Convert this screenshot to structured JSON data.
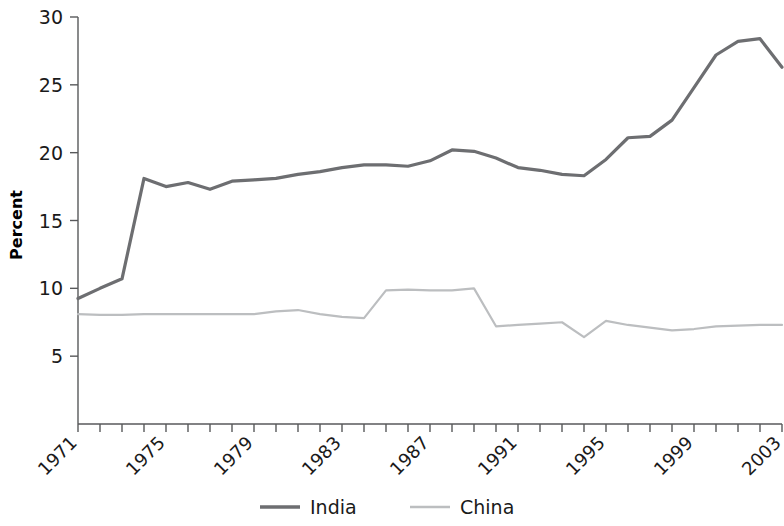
{
  "chart_data": {
    "type": "line",
    "title": "",
    "subtitle": "",
    "xlabel": "",
    "ylabel": "Percent",
    "xlim": [
      1971,
      2003
    ],
    "ylim": [
      0,
      30
    ],
    "yticks": [
      5,
      10,
      15,
      20,
      25,
      30
    ],
    "ytick_labels": [
      "5",
      "10",
      "15",
      "20",
      "25",
      "30"
    ],
    "xticks": [
      1971,
      1975,
      1979,
      1983,
      1987,
      1991,
      1995,
      1999,
      2003
    ],
    "xtick_labels": [
      "1971",
      "1975",
      "1979",
      "1983",
      "1987",
      "1991",
      "1995",
      "1999",
      "2003"
    ],
    "xtick_minor_every": 1,
    "grid": false,
    "legend_position": "bottom-center",
    "x": [
      1971,
      1972,
      1973,
      1974,
      1975,
      1976,
      1977,
      1978,
      1979,
      1980,
      1981,
      1982,
      1983,
      1984,
      1985,
      1986,
      1987,
      1988,
      1989,
      1990,
      1991,
      1992,
      1993,
      1994,
      1995,
      1996,
      1997,
      1998,
      1999,
      2000,
      2001,
      2002,
      2003
    ],
    "series": [
      {
        "name": "India",
        "color": "#6d6e71",
        "line_width": 3.2,
        "values": [
          9.25,
          10.0,
          10.7,
          18.1,
          17.5,
          17.8,
          17.3,
          17.9,
          18.0,
          18.1,
          18.4,
          18.6,
          18.9,
          19.1,
          19.1,
          19.0,
          19.4,
          20.2,
          20.1,
          19.6,
          18.9,
          18.7,
          18.4,
          18.3,
          19.5,
          21.1,
          21.2,
          22.4,
          24.8,
          27.2,
          28.2,
          28.4,
          26.3
        ]
      },
      {
        "name": "China",
        "color": "#bcbec0",
        "line_width": 2.2,
        "values": [
          8.1,
          8.05,
          8.05,
          8.1,
          8.1,
          8.1,
          8.1,
          8.1,
          8.1,
          8.3,
          8.4,
          8.1,
          7.9,
          7.8,
          9.85,
          9.9,
          9.85,
          9.85,
          10.0,
          7.2,
          7.3,
          7.4,
          7.5,
          6.4,
          7.6,
          7.3,
          7.1,
          6.9,
          7.0,
          7.2,
          7.25,
          7.3,
          7.3
        ]
      }
    ],
    "legend": [
      {
        "label": "India",
        "color": "#6d6e71",
        "line_width": 3.4
      },
      {
        "label": "China",
        "color": "#bcbec0",
        "line_width": 2.4
      }
    ]
  },
  "axis": {
    "spine_color": "#58595b"
  }
}
